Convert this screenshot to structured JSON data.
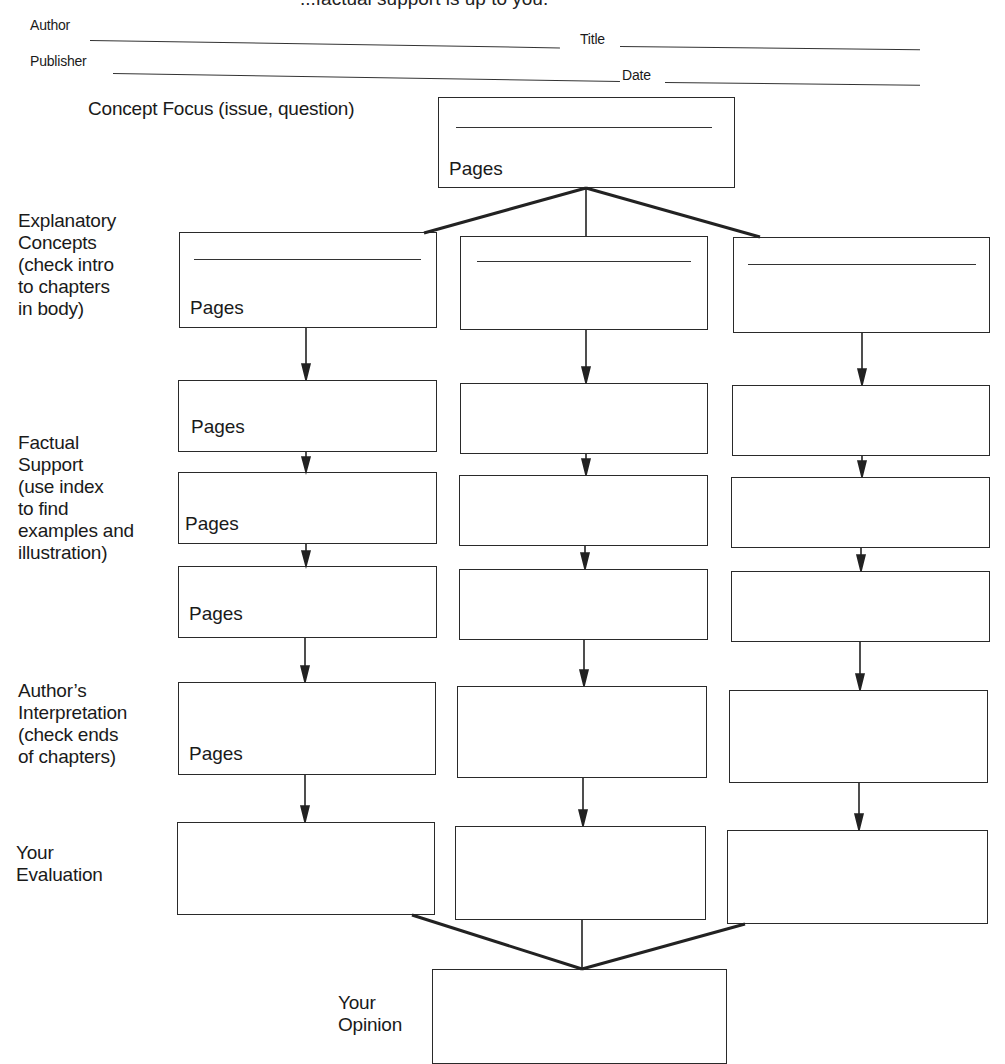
{
  "header": {
    "clipped_instruction": "...factual support is up to you.",
    "fields": [
      {
        "label": "Author",
        "value": ""
      },
      {
        "label": "Title",
        "value": ""
      },
      {
        "label": "Publisher",
        "value": ""
      },
      {
        "label": "Date",
        "value": ""
      }
    ]
  },
  "concept": {
    "label": "Concept Focus (issue, question)",
    "pages_label": "Pages"
  },
  "rows": [
    {
      "label": [
        "Explanatory",
        "Concepts",
        "(check intro",
        "to chapters",
        "in body)"
      ],
      "pages_label": "Pages"
    },
    {
      "label": [],
      "pages_label": "Pages"
    },
    {
      "label": [
        "Factual",
        "Support",
        "(use index",
        "to find",
        "examples and",
        "illustration)"
      ],
      "pages_label": "Pages"
    },
    {
      "label": [],
      "pages_label": "Pages"
    },
    {
      "label": [
        "Author’s",
        "Interpretation",
        "(check ends",
        "of chapters)"
      ],
      "pages_label": "Pages"
    },
    {
      "label": [
        "Your",
        "Evaluation"
      ],
      "pages_label": ""
    }
  ],
  "opinion": {
    "label": [
      "Your",
      "Opinion"
    ]
  }
}
